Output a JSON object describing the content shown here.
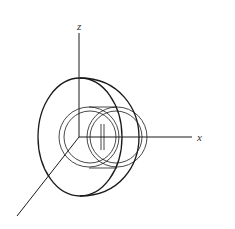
{
  "diagram": {
    "type": "3d-axes-with-toroidal-surfaces",
    "axes": {
      "z_label": "z",
      "x_label": "x"
    },
    "colors": {
      "stroke": "#1a1a1a",
      "background": "#ffffff"
    }
  }
}
